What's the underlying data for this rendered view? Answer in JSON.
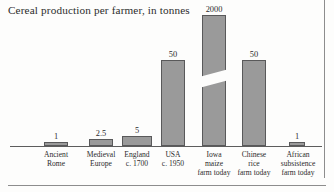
{
  "chart_title": "Cereal production per farmer, in tonnes",
  "colors": {
    "bar_fill": "#9a9a9a",
    "bar_outline": "#59595a",
    "axis": "#5d5d5d",
    "text": "#2c2c2c",
    "frame_rule": "#8d8d8d",
    "background": "#fdfdfc"
  },
  "chart_data": {
    "type": "bar",
    "title": "Cereal production per farmer, in tonnes",
    "xlabel": "",
    "ylabel": "tonnes",
    "grid": false,
    "legend": "none",
    "axis_break": true,
    "axis_break_note": "The 'Iowa maize farm today' bar is drawn with a diagonal break, indicating a truncated vertical scale.",
    "categories": [
      "Ancient Rome",
      "Medieval Europe",
      "England c. 1700",
      "USA c. 1950",
      "Iowa maize farm today",
      "Chinese rice farm today",
      "African subsistence farm today"
    ],
    "values": [
      1,
      2.5,
      5,
      50,
      2000,
      50,
      1
    ],
    "value_labels": [
      "1",
      "2.5",
      "5",
      "50",
      "2000",
      "50",
      "1"
    ]
  },
  "bars": [
    {
      "id": "ancient-rome",
      "value_label": "1",
      "label_lines": [
        "Ancient",
        "Rome"
      ],
      "left": 44,
      "width": 24,
      "height": 4,
      "label_left": 30,
      "label_width": 52,
      "has_break": false
    },
    {
      "id": "medieval-europe",
      "value_label": "2.5",
      "label_lines": [
        "Medieval",
        "Europe"
      ],
      "left": 89,
      "width": 24,
      "height": 7,
      "label_left": 75,
      "label_width": 52,
      "has_break": false
    },
    {
      "id": "england-c-1700",
      "value_label": "5",
      "label_lines": [
        "England",
        "c. 1700"
      ],
      "left": 122,
      "width": 30,
      "height": 10,
      "label_left": 111,
      "label_width": 52,
      "has_break": false
    },
    {
      "id": "usa-c-1950",
      "value_label": "50",
      "label_lines": [
        "USA",
        "c. 1950"
      ],
      "left": 161,
      "width": 24,
      "height": 86,
      "label_left": 147,
      "label_width": 52,
      "has_break": false
    },
    {
      "id": "iowa-maize-farm-today",
      "value_label": "2000",
      "label_lines": [
        "Iowa",
        "maize",
        "farm today"
      ],
      "left": 202,
      "width": 24,
      "height": 131,
      "label_left": 188,
      "label_width": 52,
      "has_break": true
    },
    {
      "id": "chinese-rice-farm-today",
      "value_label": "50",
      "label_lines": [
        "Chinese",
        "rice",
        "farm today"
      ],
      "left": 242,
      "width": 24,
      "height": 86,
      "label_left": 228,
      "label_width": 52,
      "has_break": false
    },
    {
      "id": "african-subsistence-farm-today",
      "value_label": "1",
      "label_lines": [
        "African",
        "subsistence",
        "farm today"
      ],
      "left": 289,
      "width": 16,
      "height": 4,
      "label_left": 268,
      "label_width": 60,
      "has_break": false
    }
  ]
}
